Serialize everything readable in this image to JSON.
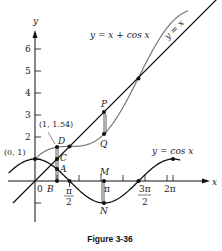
{
  "figure": {
    "caption": "Figure 3-36",
    "axes": {
      "x_label": "x",
      "y_label": "y",
      "y_ticks": [
        "2",
        "3",
        "4",
        "5",
        "6"
      ],
      "x_ticks": [
        "π/2",
        "π",
        "3π/2",
        "2π"
      ],
      "origin_label": "0"
    },
    "curves": {
      "line": {
        "label": "y = x",
        "color": "#111111"
      },
      "sum": {
        "label": "y = x + cos x",
        "color": "#777777"
      },
      "cos": {
        "label": "y = cos x",
        "color": "#111111"
      }
    },
    "points": {
      "zero_one": "(0, 1)",
      "one_154": "(1, 1.54)",
      "A": "A",
      "B": "B",
      "C": "C",
      "D": "D",
      "P": "P",
      "Q": "Q",
      "M": "M",
      "N": "N"
    }
  },
  "chart_data": {
    "type": "line",
    "title": "Figure 3-36",
    "xlabel": "x",
    "ylabel": "y",
    "x_ticks": [
      "π/2",
      "π",
      "3π/2",
      "2π"
    ],
    "y_ticks": [
      2,
      3,
      4,
      5,
      6
    ],
    "xlim": [
      -1.2,
      7.9
    ],
    "ylim": [
      -1.5,
      7.2
    ],
    "grid": false,
    "series": [
      {
        "name": "y = x",
        "function": "x",
        "domain": [
          -1,
          8.3
        ]
      },
      {
        "name": "y = x + cos x",
        "function": "x + cos(x)",
        "domain": [
          0,
          7
        ]
      },
      {
        "name": "y = cos x",
        "function": "cos(x)",
        "domain": [
          -1.2,
          6.6
        ]
      }
    ],
    "annotations": [
      {
        "label": "(0, 1)",
        "x": 0,
        "y": 1
      },
      {
        "label": "(1, 1.54)",
        "x": 1,
        "y": 1.54,
        "point": "D"
      },
      {
        "label": "C",
        "x": 1,
        "y": 1
      },
      {
        "label": "A",
        "x": 1,
        "y": 0.54
      },
      {
        "label": "B",
        "x": 1,
        "y": 0
      },
      {
        "label": "P",
        "x": 3.14,
        "y": 3.14
      },
      {
        "label": "Q",
        "x": 3.14,
        "y": 2.14
      },
      {
        "label": "M",
        "x": 3.14,
        "y": 0
      },
      {
        "label": "N",
        "x": 3.14,
        "y": -1
      }
    ]
  }
}
